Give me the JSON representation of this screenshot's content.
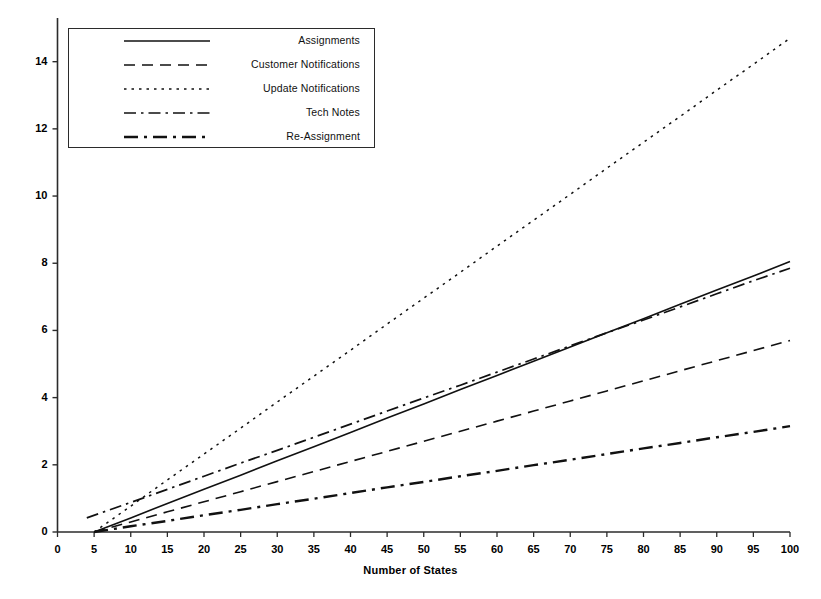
{
  "chart_data": {
    "type": "line",
    "title": "",
    "subtitle": "",
    "xlabel": "Number of States",
    "ylabel": "",
    "xlim": [
      0,
      100
    ],
    "ylim": [
      0,
      15.3
    ],
    "x_ticks": [
      0,
      5,
      10,
      15,
      20,
      25,
      30,
      35,
      40,
      45,
      50,
      55,
      60,
      65,
      70,
      75,
      80,
      85,
      90,
      95,
      100
    ],
    "y_ticks": [
      0,
      2,
      4,
      6,
      8,
      10,
      12,
      14
    ],
    "x_tick_labels": [
      "0",
      "5",
      "10",
      "15",
      "20",
      "25",
      "30",
      "35",
      "40",
      "45",
      "50",
      "55",
      "60",
      "65",
      "70",
      "75",
      "80",
      "85",
      "90",
      "95",
      "100"
    ],
    "y_tick_labels": [
      "0",
      "2",
      "4",
      "6",
      "8",
      "10",
      "12",
      "14"
    ],
    "grid": false,
    "legend_position": "upper-left",
    "x": [
      5,
      10,
      15,
      20,
      25,
      30,
      35,
      40,
      45,
      50,
      55,
      60,
      65,
      70,
      75,
      80,
      85,
      90,
      95,
      100
    ],
    "series": [
      {
        "name": "Assignments",
        "dash": "solid",
        "color": "#111111",
        "width": 1.6,
        "x": [
          5,
          10,
          15,
          20,
          25,
          30,
          35,
          40,
          45,
          50,
          55,
          60,
          65,
          70,
          75,
          80,
          85,
          90,
          95,
          100
        ],
        "values": [
          0.0,
          0.42,
          0.85,
          1.27,
          1.69,
          2.12,
          2.54,
          2.96,
          3.39,
          3.81,
          4.24,
          4.66,
          5.08,
          5.51,
          5.93,
          6.35,
          6.78,
          7.2,
          7.62,
          8.05
        ]
      },
      {
        "name": "Customer Notifications",
        "dash": "dashed",
        "color": "#111111",
        "width": 1.6,
        "x": [
          5,
          10,
          15,
          20,
          25,
          30,
          35,
          40,
          45,
          50,
          55,
          60,
          65,
          70,
          75,
          80,
          85,
          90,
          95,
          100
        ],
        "values": [
          0.0,
          0.3,
          0.6,
          0.9,
          1.2,
          1.5,
          1.8,
          2.1,
          2.4,
          2.7,
          3.0,
          3.3,
          3.6,
          3.9,
          4.2,
          4.5,
          4.8,
          5.1,
          5.4,
          5.7
        ]
      },
      {
        "name": "Update Notifications",
        "dash": "dotted",
        "color": "#111111",
        "width": 1.5,
        "x": [
          5,
          10,
          15,
          20,
          25,
          30,
          35,
          40,
          45,
          50,
          55,
          60,
          65,
          70,
          75,
          80,
          85,
          90,
          95,
          100
        ],
        "values": [
          0.0,
          0.77,
          1.55,
          2.32,
          3.09,
          3.87,
          4.64,
          5.41,
          6.19,
          6.96,
          7.73,
          8.51,
          9.28,
          10.05,
          10.83,
          11.6,
          12.37,
          13.15,
          13.92,
          14.7
        ]
      },
      {
        "name": "Tech Notes",
        "dash": "dashdot",
        "color": "#111111",
        "width": 1.7,
        "x": [
          4,
          10,
          15,
          20,
          25,
          30,
          35,
          40,
          45,
          50,
          55,
          60,
          65,
          70,
          75,
          80,
          85,
          90,
          95,
          100
        ],
        "values": [
          0.42,
          0.88,
          1.27,
          1.66,
          2.05,
          2.43,
          2.82,
          3.21,
          3.6,
          3.99,
          4.37,
          4.76,
          5.15,
          5.54,
          5.93,
          6.31,
          6.7,
          7.09,
          7.48,
          7.85
        ]
      },
      {
        "name": "Re-Assignment",
        "dash": "dashdotdot",
        "color": "#111111",
        "width": 2.4,
        "x": [
          5,
          10,
          15,
          20,
          25,
          30,
          35,
          40,
          45,
          50,
          55,
          60,
          65,
          70,
          75,
          80,
          85,
          90,
          95,
          100
        ],
        "values": [
          0.0,
          0.17,
          0.33,
          0.5,
          0.66,
          0.83,
          0.99,
          1.16,
          1.33,
          1.49,
          1.66,
          1.82,
          1.99,
          2.15,
          2.32,
          2.49,
          2.65,
          2.82,
          2.98,
          3.15
        ]
      }
    ]
  },
  "axes": {
    "x_title": "Number of States",
    "y_tick_labels": [
      "14",
      "12",
      "10",
      "8",
      "6",
      "4",
      "2",
      "0"
    ],
    "x_tick_labels": [
      "0",
      "5",
      "10",
      "15",
      "20",
      "25",
      "30",
      "35",
      "40",
      "45",
      "50",
      "55",
      "60",
      "65",
      "70",
      "75",
      "80",
      "85",
      "90",
      "95",
      "100"
    ]
  },
  "legend": {
    "entries": [
      {
        "label": "Assignments",
        "style": "solid"
      },
      {
        "label": "Customer Notifications",
        "style": "dashed"
      },
      {
        "label": "Update Notifications",
        "style": "dotted"
      },
      {
        "label": "Tech Notes",
        "style": "dashdot"
      },
      {
        "label": "Re-Assignment",
        "style": "dashdotdot"
      }
    ]
  },
  "colors": {
    "line": "#111111",
    "axis": "#2b2b2b",
    "background": "#ffffff",
    "text": "#000000"
  }
}
